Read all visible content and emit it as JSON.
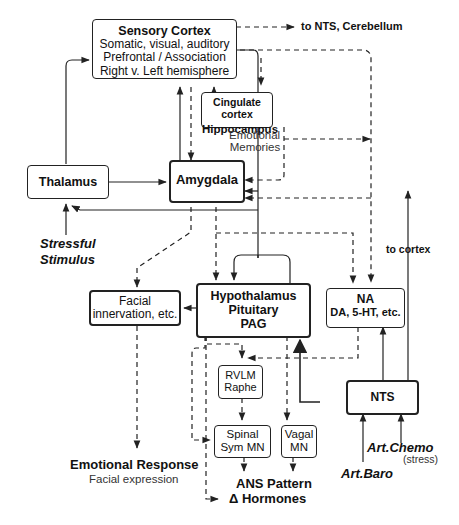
{
  "nodes": {
    "sensory_cortex": {
      "title": "Sensory Cortex",
      "lines": [
        "Somatic, visual, auditory",
        "Prefrontal / Association",
        "Right v. Left hemisphere"
      ]
    },
    "cingulate": {
      "line1": "Cingulate cortex",
      "line2": "Hippocampus"
    },
    "thalamus": {
      "title": "Thalamus"
    },
    "amygdala": {
      "title": "Amygdala"
    },
    "hypothalamus": {
      "lines": [
        "Hypothalamus",
        "Pituitary",
        "PAG"
      ]
    },
    "na": {
      "line1": "NA",
      "line2": "DA, 5-HT, etc."
    },
    "facial": {
      "line1": "Facial",
      "line2": "innervation, etc."
    },
    "rvlm": {
      "line1": "RVLM",
      "line2": "Raphe"
    },
    "spinal": {
      "line1": "Spinal",
      "line2": "Sym MN"
    },
    "vagal": {
      "line1": "Vagal",
      "line2": "MN"
    },
    "nts": {
      "title": "NTS"
    }
  },
  "labels": {
    "to_nts_cerebellum": "to NTS, Cerebellum",
    "emotional_memories": [
      "Emotional",
      "Memories"
    ],
    "stressful_stimulus": [
      "Stressful",
      "Stimulus"
    ],
    "to_cortex": "to cortex",
    "emotional_response": "Emotional Response",
    "facial_expression": "Facial expression",
    "ans_pattern": "ANS Pattern",
    "hormones": "Δ Hormones",
    "art_chemo": "Art.Chemo",
    "stress": "(stress)",
    "art_baro": "Art.Baro"
  },
  "colors": {
    "stroke": "#222222",
    "text": "#111111",
    "background": "#ffffff"
  }
}
